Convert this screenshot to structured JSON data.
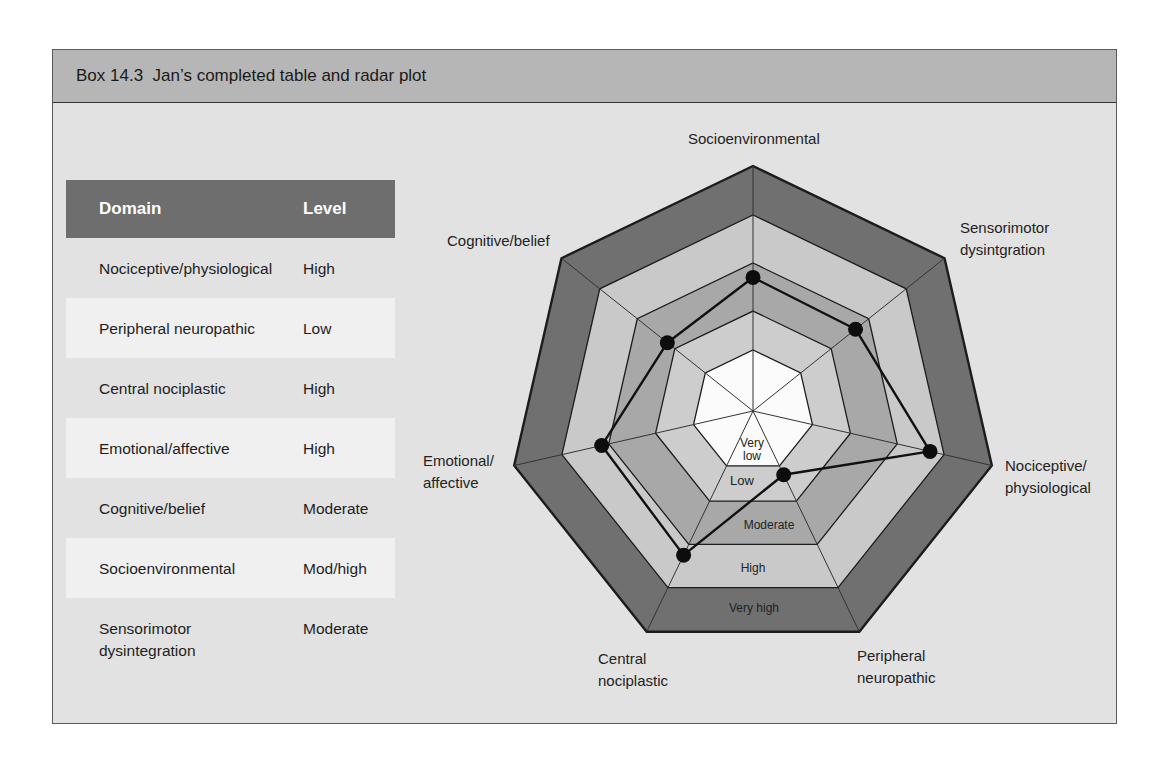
{
  "box": {
    "title": "Box 14.3  Jan’s completed table and radar plot"
  },
  "colors": {
    "header_bar": "#b6b6b6",
    "panel_bg": "#e2e2e2",
    "table_header_bg": "#6e6e6e",
    "table_row_alt_bg": "#f0f0f0",
    "level_fills": [
      "#fbfbfb",
      "#cdcdcd",
      "#a8a8a8",
      "#c9c9c9",
      "#707070"
    ],
    "data_line": "#111111"
  },
  "table": {
    "headers": {
      "domain": "Domain",
      "level": "Level"
    },
    "rows": [
      {
        "domain": "Nociceptive/physiological",
        "level": "High"
      },
      {
        "domain": "Peripheral neuropathic",
        "level": "Low"
      },
      {
        "domain": "Central nociplastic",
        "level": "High"
      },
      {
        "domain": "Emotional/affective",
        "level": "High"
      },
      {
        "domain": "Cognitive/belief",
        "level": "Moderate"
      },
      {
        "domain": "Socioenvironmental",
        "level": "Mod/high"
      },
      {
        "domain": "Sensorimotor\ndysintegration",
        "level": "Moderate"
      }
    ]
  },
  "chart_data": {
    "type": "radar",
    "title": "Jan’s completed table and radar plot",
    "axes": [
      "Socioenvironmental",
      "Sensorimotor dysintgration",
      "Nociceptive/physiological",
      "Peripheral neuropathic",
      "Central nociplastic",
      "Emotional/affective",
      "Cognitive/belief"
    ],
    "axis_labels": [
      "Socioenvironmental",
      "Sensorimotor\ndysintgration",
      "Nociceptive/\nphysiological",
      "Peripheral\nneuropathic",
      "Central\nnociplastic",
      "Emotional/\naffective",
      "Cognitive/belief"
    ],
    "levels": [
      "Very low",
      "Low",
      "Moderate",
      "High",
      "Very high"
    ],
    "level_scale": "score 0-5; ring k spans k-1..k (Very low=0-1, Low=1-2, Moderate=2-3, High=3-4, Very high=4-5)",
    "ring_boundaries_fraction": [
      0.249,
      0.408,
      0.604,
      0.8,
      1.0
    ],
    "series": [
      {
        "name": "Jan",
        "levels": [
          "Mod/high",
          "Moderate",
          "High",
          "Low",
          "High",
          "High",
          "Moderate"
        ],
        "values": [
          2.7,
          2.65,
          3.7,
          1.25,
          3.25,
          3.15,
          2.2
        ]
      }
    ],
    "grid": true,
    "legend": null
  }
}
